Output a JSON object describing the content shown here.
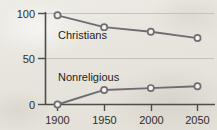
{
  "chart_data": {
    "type": "line",
    "title": "",
    "subtitle": "",
    "xlabel": "",
    "ylabel": "",
    "x": [
      1900,
      1950,
      2000,
      2050
    ],
    "categories": [
      "1900",
      "1950",
      "2000",
      "2050"
    ],
    "xlim": [
      1885,
      2062
    ],
    "ylim": [
      0,
      100
    ],
    "yticks": [
      0,
      50,
      100
    ],
    "ytick_labels": [
      "0",
      "50",
      "100"
    ],
    "xticks": [
      1900,
      1950,
      2000,
      2050
    ],
    "xtick_labels": [
      "1900",
      "1950",
      "2000",
      "2050"
    ],
    "grid": "horizontal-faint",
    "legend": "inline-labels",
    "marker": "open-circle",
    "series": [
      {
        "name": "Christians",
        "label": "Christians",
        "values": [
          98,
          85,
          80,
          73
        ],
        "color": "#6e6d71",
        "label_x": 1904,
        "label_y": 70
      },
      {
        "name": "Nonreligious",
        "label": "Nonreligious",
        "values": [
          0,
          16,
          18,
          20
        ],
        "color": "#6e6d71",
        "label_x": 1904,
        "label_y": 30
      }
    ],
    "axis_color": "#55534f",
    "gridline_color": "#c9c5bc",
    "marker_fill": "#f2f0ea",
    "background": "#e9e7e1"
  }
}
